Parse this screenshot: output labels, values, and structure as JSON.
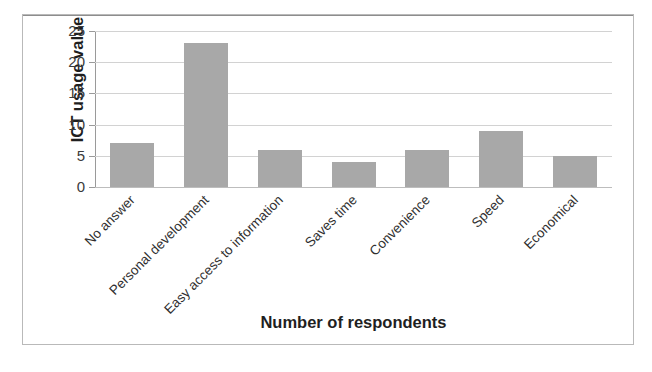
{
  "figure": {
    "background_color": "#ffffff",
    "frame_color": "#b9b9b9"
  },
  "chart_data": {
    "type": "bar",
    "title": "",
    "subtitle": "",
    "categories": [
      "No answer",
      "Personal development",
      "Easy access to information",
      "Saves time",
      "Convenience",
      "Speed",
      "Economical"
    ],
    "values": [
      7,
      23,
      6,
      4,
      6,
      9,
      5
    ],
    "xlabel": "Number of respondents",
    "ylabel": "ICT usage value",
    "ylim": [
      0,
      25
    ],
    "ytick_labels": [
      "0",
      "5",
      "10",
      "15",
      "20",
      "25"
    ],
    "ytick_values": [
      0,
      5,
      10,
      15,
      20,
      25
    ],
    "xtick_rotation_deg": -45,
    "grid": "horizontal",
    "gridline_color": "#d2d2d2",
    "legend": "none",
    "series": [
      {
        "name": "ICT usage value",
        "color": "#a8a8a8",
        "values": [
          7,
          23,
          6,
          4,
          6,
          9,
          5
        ]
      }
    ]
  }
}
